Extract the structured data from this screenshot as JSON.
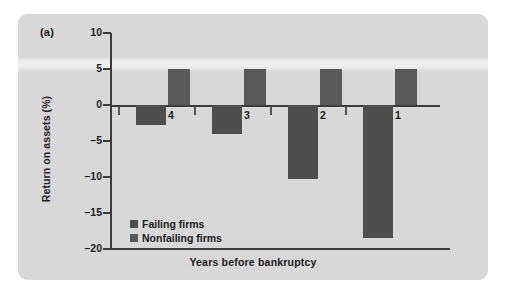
{
  "figure": {
    "panel_label": "(a)",
    "background_color": "#d9d9d9",
    "bar_color_failing": "#4e4e4e",
    "bar_color_nonfailing": "#595959",
    "axis_color": "#3b3b3b"
  },
  "chart_data": {
    "type": "bar",
    "title": "",
    "subtitle": "",
    "xlabel": "Years before bankruptcy",
    "ylabel": "Return on assets (%)",
    "categories": [
      "4",
      "3",
      "2",
      "1"
    ],
    "ylim": [
      -20,
      10
    ],
    "yticks": [
      10,
      5,
      0,
      -5,
      -10,
      -15,
      -20
    ],
    "ytick_labels": [
      "10",
      "5",
      "0",
      "-5",
      "-10",
      "-15",
      "-20"
    ],
    "grid": false,
    "legend_position": "inside-bottom-left",
    "series": [
      {
        "name": "Failing firms",
        "color": "#4e4e4e",
        "values": [
          -2.8,
          -4.0,
          -10.3,
          -18.5
        ]
      },
      {
        "name": "Nonfailing firms",
        "color": "#595959",
        "values": [
          5.0,
          5.0,
          5.0,
          5.0
        ]
      }
    ],
    "annotations": [
      "(a)"
    ]
  },
  "legend": {
    "items": [
      {
        "label": "Failing firms"
      },
      {
        "label": "Nonfailing firms"
      }
    ]
  }
}
